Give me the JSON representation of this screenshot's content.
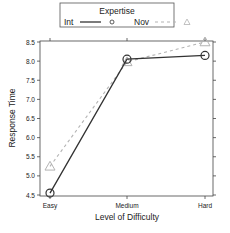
{
  "chart_data": {
    "type": "line",
    "title": "",
    "xlabel": "Level of Difficulty",
    "ylabel": "Response Time",
    "categories": [
      "Easy",
      "Medium",
      "Hard"
    ],
    "ylim": [
      4.5,
      8.5
    ],
    "yticks": [
      4.5,
      5.0,
      5.5,
      6.0,
      6.5,
      7.0,
      7.5,
      8.0,
      8.5
    ],
    "ytick_labels": [
      "4.5",
      "5.0",
      "5.5",
      "6.0",
      "6.5",
      "7.0",
      "7.5",
      "8.0",
      "8.5"
    ],
    "grid": false,
    "legend": {
      "title": "Expertise",
      "position": "top",
      "entries": [
        {
          "label": "Int",
          "line": "solid",
          "marker": "circle",
          "color": "#333333"
        },
        {
          "label": "Nov",
          "line": "dashed",
          "marker": "triangle",
          "color": "#b3b3b3"
        }
      ]
    },
    "series": [
      {
        "name": "Int",
        "values": [
          4.55,
          8.05,
          8.15
        ],
        "color": "#333333",
        "line": "solid",
        "marker": "circle"
      },
      {
        "name": "Nov",
        "values": [
          5.25,
          7.98,
          8.5
        ],
        "color": "#b3b3b3",
        "line": "dashed",
        "marker": "triangle"
      }
    ]
  }
}
